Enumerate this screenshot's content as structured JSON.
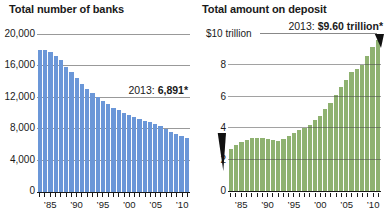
{
  "chart_data": [
    {
      "type": "bar",
      "title": "Total number of banks",
      "x": [
        1985,
        1986,
        1987,
        1988,
        1989,
        1990,
        1991,
        1992,
        1993,
        1994,
        1995,
        1996,
        1997,
        1998,
        1999,
        2000,
        2001,
        2002,
        2003,
        2004,
        2005,
        2006,
        2007,
        2008,
        2009,
        2010,
        2011,
        2012,
        2013
      ],
      "values": [
        18043,
        18083,
        17883,
        17316,
        16781,
        15986,
        15281,
        14475,
        13809,
        13176,
        12603,
        12100,
        11605,
        11158,
        10740,
        10385,
        10089,
        9778,
        9516,
        9253,
        9041,
        8867,
        8681,
        8441,
        8012,
        7658,
        7357,
        7083,
        6891
      ],
      "ylim": [
        0,
        20000
      ],
      "yticks": [
        0,
        4000,
        8000,
        12000,
        16000,
        20000
      ],
      "ytick_labels": [
        "0",
        "4,000",
        "8,000",
        "12,000",
        "16,000",
        "20,000"
      ],
      "xtick_labels": [
        "’85",
        "’90",
        "’95",
        "’00",
        "’05",
        "’10"
      ],
      "annotation": {
        "prefix": "2013: ",
        "value": "6,891*"
      },
      "bar_color": "#6B97D8",
      "grid": "on",
      "legend": "none"
    },
    {
      "type": "bar",
      "title": "Total amount on deposit",
      "x": [
        1985,
        1986,
        1987,
        1988,
        1989,
        1990,
        1991,
        1992,
        1993,
        1994,
        1995,
        1996,
        1997,
        1998,
        1999,
        2000,
        2001,
        2002,
        2003,
        2004,
        2005,
        2006,
        2007,
        2008,
        2009,
        2010,
        2011,
        2012,
        2013
      ],
      "values": [
        2.7,
        2.9,
        3.1,
        3.25,
        3.35,
        3.4,
        3.35,
        3.3,
        3.25,
        3.2,
        3.3,
        3.5,
        3.7,
        3.9,
        4.0,
        4.2,
        4.5,
        4.8,
        5.2,
        5.6,
        6.1,
        6.6,
        7.1,
        7.6,
        7.8,
        8.0,
        8.6,
        9.2,
        9.6
      ],
      "units": "trillion USD",
      "ylim": [
        0,
        10
      ],
      "yticks": [
        0,
        2,
        4,
        6,
        8,
        10
      ],
      "ytick_labels": [
        "0",
        "2",
        "4",
        "6",
        "8",
        "$10 trillion"
      ],
      "xtick_labels": [
        "’85",
        "’90",
        "’95",
        "’00",
        "’05",
        "’10"
      ],
      "annotation": {
        "prefix": "2013: ",
        "value": "$9.60 trillion*"
      },
      "bar_color": "#8FB271",
      "grid": "on",
      "legend": "none"
    }
  ]
}
